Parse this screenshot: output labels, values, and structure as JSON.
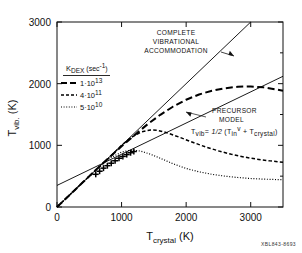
{
  "figure": {
    "code_label": "XBL843-8693"
  },
  "chart_data": {
    "type": "line",
    "title": "",
    "xlabel": "T_crystal (K)",
    "ylabel": "T_vib. (K)",
    "xlabel_parts": {
      "main": "T",
      "sub": "crystal",
      "unit": "(K)"
    },
    "ylabel_parts": {
      "main": "T",
      "sub": "vib.",
      "unit": "(K)"
    },
    "xlim": [
      0,
      3500
    ],
    "ylim": [
      0,
      3000
    ],
    "xticks": [
      0,
      1000,
      2000,
      3000
    ],
    "yticks": [
      0,
      1000,
      2000,
      3000
    ],
    "xticklabels": [
      "0",
      "1000",
      "2000",
      "3000"
    ],
    "yticklabels": [
      "0",
      "1000",
      "2000",
      "3000"
    ],
    "grid": false,
    "legend_position": "upper-left",
    "series": [
      {
        "name": "complete-vibrational-accommodation",
        "style": "solid",
        "label": "COMPLETE VIBRATIONAL ACCOMMODATION",
        "x": [
          0,
          3000
        ],
        "y": [
          0,
          3000
        ]
      },
      {
        "name": "precursor-model",
        "style": "solid",
        "label": "PRECURSOR MODEL",
        "formula": "T_vib = 1/2 (T_in^v + T_crystal)",
        "x": [
          0,
          3500
        ],
        "y": [
          350,
          2120
        ]
      },
      {
        "name": "k-dex-1e13",
        "style": "long-dash",
        "legend": "1·10^13",
        "x": [
          0,
          200,
          400,
          600,
          800,
          1000,
          1200,
          1400,
          1600,
          1800,
          2000,
          2200,
          2400,
          2600,
          2800,
          3000,
          3200,
          3400,
          3500
        ],
        "y": [
          0,
          200,
          400,
          600,
          795,
          985,
          1165,
          1340,
          1495,
          1630,
          1740,
          1825,
          1885,
          1925,
          1950,
          1955,
          1940,
          1905,
          1885
        ]
      },
      {
        "name": "k-dex-4e11",
        "style": "medium-dash",
        "legend": "4·10^11",
        "x": [
          0,
          200,
          400,
          600,
          800,
          1000,
          1150,
          1300,
          1450,
          1550,
          1700,
          1900,
          2100,
          2300,
          2500,
          2700,
          2900,
          3100,
          3300,
          3500
        ],
        "y": [
          0,
          200,
          400,
          598,
          790,
          1000,
          1130,
          1215,
          1250,
          1245,
          1205,
          1130,
          1050,
          975,
          910,
          855,
          810,
          775,
          748,
          725
        ]
      },
      {
        "name": "k-dex-5e10",
        "style": "dotted",
        "legend": "5·10^10",
        "x": [
          0,
          200,
          400,
          600,
          800,
          1000,
          1100,
          1200,
          1300,
          1450,
          1600,
          1800,
          2000,
          2200,
          2400,
          2600,
          2800,
          3000,
          3200,
          3400,
          3500
        ],
        "y": [
          0,
          200,
          400,
          595,
          780,
          890,
          915,
          920,
          905,
          855,
          790,
          700,
          625,
          570,
          530,
          500,
          478,
          462,
          452,
          445,
          442
        ]
      }
    ],
    "data_points": {
      "name": "experimental-data",
      "marker": "plus",
      "x": [
        600,
        660,
        720,
        780,
        840,
        900,
        960,
        1020,
        1080,
        1140,
        1190
      ],
      "y": [
        530,
        580,
        630,
        670,
        710,
        750,
        790,
        820,
        850,
        880,
        900
      ]
    },
    "annotations": [
      {
        "name": "complete-accommodation-annotation",
        "lines": [
          "COMPLETE",
          "VIBRATIONAL",
          "ACCOMMODATION"
        ],
        "arrow_to_x": 2460,
        "arrow_to_y": 2460
      },
      {
        "name": "precursor-model-annotation",
        "lines": [
          "PRECURSOR",
          "MODEL"
        ],
        "formula_plain": "Tvib = 1/2 (Tin^v + Tcrystal)",
        "arrow_to_x": 2180,
        "arrow_to_y": 1455
      }
    ],
    "legend": {
      "title_main": "K",
      "title_sub": "DEX",
      "title_unit": "(sec",
      "title_unit_sup": "-1",
      "title_unit_close": ")",
      "entries": [
        {
          "style": "long-dash",
          "mantissa": "1",
          "dot": "·",
          "base": "10",
          "exp": "13"
        },
        {
          "style": "medium-dash",
          "mantissa": "4",
          "dot": "·",
          "base": "10",
          "exp": "11"
        },
        {
          "style": "dotted",
          "mantissa": "5",
          "dot": "·",
          "base": "10",
          "exp": "10"
        }
      ]
    }
  }
}
